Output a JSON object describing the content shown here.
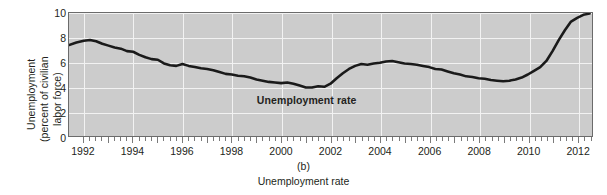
{
  "figure": {
    "panel_letter": "(b)",
    "caption": "Unemployment rate",
    "annotation": "Unemployment rate"
  },
  "axes": {
    "y_title_line1": "Unemployment",
    "y_title_line2": "(percent of civilian",
    "y_title_line3": "labor force)",
    "y_ticks": [
      "10",
      "8",
      "6",
      "4",
      "2",
      "0"
    ],
    "x_ticks": [
      "1992",
      "1994",
      "1996",
      "1998",
      "2000",
      "2002",
      "2004",
      "2006",
      "2008",
      "2010",
      "2012"
    ]
  },
  "style": {
    "plot_background": "#cccccc",
    "gridline_color": "#f2f2f2",
    "line_color": "#1a1a1a",
    "frame_color": "#6b6b6b",
    "text_color": "#231f20"
  },
  "chart_data": {
    "type": "line",
    "title": "Unemployment rate",
    "xlabel": "",
    "ylabel": "Unemployment (percent of civilian labor force)",
    "xlim": [
      1991.4,
      2012.6
    ],
    "ylim": [
      0,
      10
    ],
    "grid": true,
    "legend": "none",
    "annotations": [
      {
        "text": "Unemployment rate",
        "x": 2001.0,
        "y": 3.0,
        "bold": true
      }
    ],
    "series": [
      {
        "name": "Unemployment rate",
        "units": "percent",
        "x": [
          1991.4,
          1991.7,
          1992.0,
          1992.25,
          1992.5,
          1992.75,
          1993.0,
          1993.25,
          1993.5,
          1993.75,
          1994.0,
          1994.25,
          1994.5,
          1994.75,
          1995.0,
          1995.25,
          1995.5,
          1995.75,
          1996.0,
          1996.25,
          1996.5,
          1996.75,
          1997.0,
          1997.25,
          1997.5,
          1997.75,
          1998.0,
          1998.25,
          1998.5,
          1998.75,
          1999.0,
          1999.25,
          1999.5,
          1999.75,
          2000.0,
          2000.25,
          2000.5,
          2000.75,
          2001.0,
          2001.25,
          2001.5,
          2001.75,
          2002.0,
          2002.25,
          2002.5,
          2002.75,
          2003.0,
          2003.25,
          2003.5,
          2003.75,
          2004.0,
          2004.25,
          2004.5,
          2004.75,
          2005.0,
          2005.25,
          2005.5,
          2005.75,
          2006.0,
          2006.25,
          2006.5,
          2006.75,
          2007.0,
          2007.25,
          2007.5,
          2007.75,
          2008.0,
          2008.25,
          2008.5,
          2008.75,
          2009.0,
          2009.25,
          2009.5,
          2009.75,
          2010.0,
          2010.25,
          2010.5,
          2010.75,
          2011.0,
          2011.25,
          2011.5,
          2011.75,
          2012.0,
          2012.25,
          2012.5
        ],
        "y": [
          7.4,
          7.6,
          7.75,
          7.8,
          7.7,
          7.5,
          7.35,
          7.2,
          7.1,
          6.9,
          6.85,
          6.6,
          6.4,
          6.25,
          6.2,
          5.9,
          5.75,
          5.7,
          5.85,
          5.7,
          5.6,
          5.5,
          5.45,
          5.35,
          5.2,
          5.05,
          5.0,
          4.9,
          4.85,
          4.75,
          4.6,
          4.5,
          4.4,
          4.35,
          4.3,
          4.35,
          4.25,
          4.1,
          3.95,
          3.95,
          4.05,
          4.0,
          4.25,
          4.7,
          5.1,
          5.45,
          5.7,
          5.85,
          5.8,
          5.9,
          5.95,
          6.05,
          6.1,
          6.0,
          5.9,
          5.85,
          5.8,
          5.7,
          5.6,
          5.45,
          5.4,
          5.25,
          5.1,
          5.0,
          4.85,
          4.8,
          4.7,
          4.65,
          4.55,
          4.5,
          4.45,
          4.5,
          4.6,
          4.75,
          5.0,
          5.3,
          5.6,
          6.1,
          6.9,
          7.8,
          8.6,
          9.3,
          9.6,
          9.85,
          9.95
        ]
      }
    ],
    "series_tail": {
      "note": "continuation beyond 2010 peak",
      "x": [
        2010.5,
        2010.75,
        2011.0,
        2011.25,
        2011.5,
        2011.75,
        2012.0,
        2012.25,
        2012.5
      ],
      "y": [
        9.9,
        9.6,
        9.55,
        9.5,
        9.35,
        9.1,
        8.9,
        8.5,
        8.1
      ]
    },
    "key_points": [
      {
        "label": "1992 peak",
        "x": 1992.25,
        "y": 7.8
      },
      {
        "label": "2000 trough",
        "x": 2001.0,
        "y": 3.95
      },
      {
        "label": "2003 local peak",
        "x": 2004.5,
        "y": 6.1
      },
      {
        "label": "2006-07 trough",
        "x": 2007.75,
        "y": 4.5
      },
      {
        "label": "2009-10 peak",
        "x": 2010.0,
        "y": 10.0
      },
      {
        "label": "2012 end",
        "x": 2012.5,
        "y": 8.1
      }
    ]
  }
}
